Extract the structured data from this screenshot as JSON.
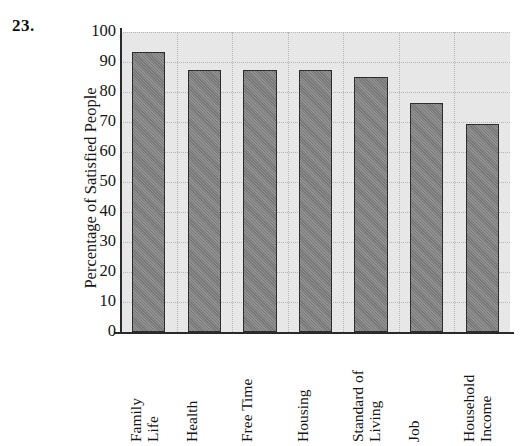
{
  "question_number": "23.",
  "chart_data": {
    "type": "bar",
    "title": "",
    "xlabel": "",
    "ylabel": "Percentage of Satisfied People",
    "categories": [
      "Family Life",
      "Health",
      "Free Time",
      "Housing",
      "Standard of Living",
      "Job",
      "Household Income"
    ],
    "category_lines": [
      [
        "Family",
        "Life"
      ],
      [
        "Health"
      ],
      [
        "Free Time"
      ],
      [
        "Housing"
      ],
      [
        "Standard of",
        "Living"
      ],
      [
        "Job"
      ],
      [
        "Household",
        "Income"
      ]
    ],
    "values": [
      93.5,
      87.5,
      87.5,
      87.5,
      85,
      76.5,
      69.5
    ],
    "ylim": [
      0,
      100
    ],
    "ytick_labels": [
      "100",
      "90",
      "80",
      "70",
      "60",
      "50",
      "40",
      "30",
      "20",
      "10",
      "0"
    ],
    "ytick_values": [
      100,
      90,
      80,
      70,
      60,
      50,
      40,
      30,
      20,
      10,
      0
    ],
    "grid": true,
    "legend": false,
    "bar_color": "#7d7d7d",
    "bar_edge_color": "#2d2d2d",
    "plot_background_color": "#e7e7e7",
    "axis_color": "#2a2a2a",
    "gridline_color": "#b6b6b6"
  }
}
